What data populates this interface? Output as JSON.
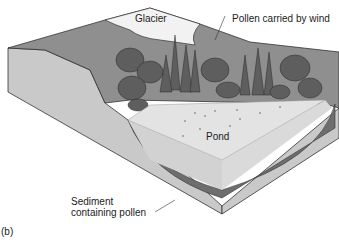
{
  "figure": {
    "panel_label": "(b)",
    "labels": {
      "glacier": "Glacier",
      "pollen_wind": "Pollen carried by wind",
      "pond": "Pond",
      "sediment_line1": "Sediment",
      "sediment_line2": "containing pollen"
    },
    "colors": {
      "ground_side": "#c9c9c9",
      "ground_top": "#8f8f8f",
      "glacier": "#f2f2f2",
      "pond_top": "#e3e3e3",
      "pond_side": "#d2d2d2",
      "sediment": "#6e6e6e",
      "trees": "#5e5e5e",
      "outline": "#333333"
    }
  }
}
